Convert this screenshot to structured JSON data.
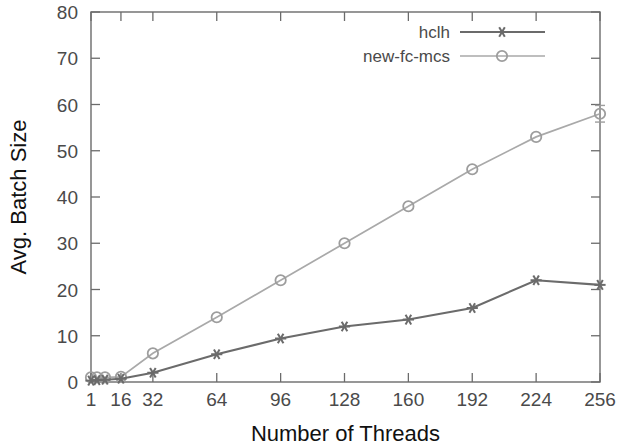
{
  "chart_data": {
    "type": "line",
    "title": "",
    "xlabel": "Number of Threads",
    "ylabel": "Avg. Batch Size",
    "xlim": [
      1,
      256
    ],
    "ylim": [
      0,
      80
    ],
    "grid": false,
    "legend_position": "top-right",
    "x": [
      1,
      4,
      8,
      16,
      32,
      64,
      96,
      128,
      160,
      192,
      224,
      256
    ],
    "xticks": [
      "1",
      "16",
      "32",
      "64",
      "96",
      "128",
      "160",
      "192",
      "224",
      "256"
    ],
    "xtick_values": [
      1,
      16,
      32,
      64,
      96,
      128,
      160,
      192,
      224,
      256
    ],
    "yticks": [
      "0",
      "10",
      "20",
      "30",
      "40",
      "50",
      "60",
      "70",
      "80"
    ],
    "ytick_values": [
      0,
      10,
      20,
      30,
      40,
      50,
      60,
      70,
      80
    ],
    "series": [
      {
        "name": "hclh",
        "marker": "star",
        "color": "#6b6b6b",
        "x": [
          1,
          4,
          8,
          16,
          32,
          64,
          96,
          128,
          160,
          192,
          224,
          256
        ],
        "values": [
          0.3,
          0.4,
          0.5,
          0.7,
          2.0,
          6.0,
          9.4,
          12.0,
          13.5,
          16.0,
          22.0,
          21.0
        ]
      },
      {
        "name": "new-fc-mcs",
        "marker": "circle",
        "color": "#a9a9a9",
        "x": [
          1,
          4,
          8,
          16,
          32,
          64,
          96,
          128,
          160,
          192,
          224,
          256
        ],
        "values": [
          1.0,
          1.0,
          1.0,
          1.1,
          6.2,
          14.0,
          22.0,
          30.0,
          38.0,
          46.0,
          53.0,
          58.0
        ],
        "errors": [
          0,
          0,
          0,
          0,
          0,
          0,
          0,
          0,
          0,
          0,
          0,
          1.8
        ]
      }
    ]
  },
  "legend": {
    "entries": [
      {
        "label": "hclh"
      },
      {
        "label": "new-fc-mcs"
      }
    ]
  },
  "axes": {
    "x_title": "Number of Threads",
    "y_title": "Avg. Batch Size"
  }
}
